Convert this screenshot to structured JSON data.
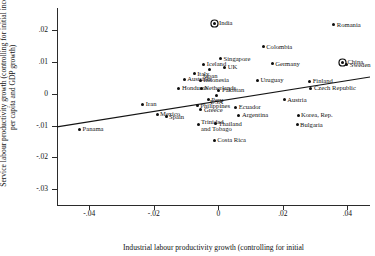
{
  "chart_data": {
    "type": "scatter",
    "title": "",
    "xlabel": "Industrial labour productivity growth (controlling for initial",
    "ylabel": "Service labour productivity growth (controlling for initial income per capita and GDP growth)",
    "xlim": [
      -0.05,
      0.047
    ],
    "ylim": [
      -0.035,
      0.027
    ],
    "xticks": [
      -0.04,
      -0.02,
      0,
      0.02,
      0.04
    ],
    "xticklabels": [
      "-.04",
      "-.02",
      "0",
      ".02",
      ".04"
    ],
    "yticks": [
      0.02,
      0.01,
      0,
      -0.01,
      -0.02,
      -0.03
    ],
    "yticklabels": [
      ".02",
      ".01",
      "0",
      "-.01",
      "-.02",
      "-.03"
    ],
    "grid": false,
    "legend": false,
    "fit_line": {
      "type": "linear",
      "x": [
        -0.05,
        0.047
      ],
      "y": [
        -0.0104,
        0.0053
      ]
    },
    "points": [
      {
        "name": "India",
        "x": -0.0012,
        "y": 0.0222,
        "highlight": true,
        "label_pos": "r"
      },
      {
        "name": "Romania",
        "x": 0.0358,
        "y": 0.0218,
        "highlight": false,
        "label_pos": "r"
      },
      {
        "name": "Colombia",
        "x": 0.0139,
        "y": 0.0148,
        "highlight": false,
        "label_pos": "r"
      },
      {
        "name": "Singapore",
        "x": 0.0007,
        "y": 0.0111,
        "highlight": false,
        "label_pos": "r"
      },
      {
        "name": "China",
        "x": 0.0386,
        "y": 0.01,
        "highlight": true,
        "label_pos": "r"
      },
      {
        "name": "Sweden",
        "x": 0.0398,
        "y": 0.0092,
        "highlight": false,
        "label_pos": "r"
      },
      {
        "name": "Iceland",
        "x": -0.0045,
        "y": 0.0093,
        "highlight": false,
        "label_pos": "r"
      },
      {
        "name": "Germany",
        "x": 0.0167,
        "y": 0.0094,
        "highlight": false,
        "label_pos": "r"
      },
      {
        "name": "Japan",
        "x": -0.0026,
        "y": 0.0078,
        "highlight": false,
        "label_pos": "c"
      },
      {
        "name": "UK",
        "x": 0.002,
        "y": 0.0083,
        "highlight": false,
        "label_pos": "r"
      },
      {
        "name": "Italy",
        "x": -0.0075,
        "y": 0.0063,
        "highlight": false,
        "label_pos": "r"
      },
      {
        "name": "Australia",
        "x": -0.0106,
        "y": 0.0045,
        "highlight": false,
        "label_pos": "r"
      },
      {
        "name": "Indonesia",
        "x": -0.0056,
        "y": 0.0043,
        "highlight": false,
        "label_pos": "r"
      },
      {
        "name": "Uruguay",
        "x": 0.0121,
        "y": 0.0043,
        "highlight": false,
        "label_pos": "r"
      },
      {
        "name": "Finland",
        "x": 0.0283,
        "y": 0.004,
        "highlight": false,
        "label_pos": "r"
      },
      {
        "name": "Honduras",
        "x": -0.0122,
        "y": 0.0018,
        "highlight": false,
        "label_pos": "r"
      },
      {
        "name": "Netherlands",
        "x": -0.0053,
        "y": 0.0018,
        "highlight": false,
        "label_pos": "r"
      },
      {
        "name": "Czech Republic",
        "x": 0.0287,
        "y": 0.0018,
        "highlight": false,
        "label_pos": "r"
      },
      {
        "name": "Pakistan",
        "x": 0.0002,
        "y": 0.0011,
        "highlight": false,
        "label_pos": "r"
      },
      {
        "name": "USA",
        "x": -0.0005,
        "y": -0.0004,
        "highlight": false,
        "label_pos": "c"
      },
      {
        "name": "Peru",
        "x": -0.0031,
        "y": -0.0018,
        "highlight": false,
        "label_pos": "r"
      },
      {
        "name": "Austria",
        "x": 0.0204,
        "y": -0.0018,
        "highlight": false,
        "label_pos": "r"
      },
      {
        "name": "Iran",
        "x": -0.0234,
        "y": -0.0033,
        "highlight": false,
        "label_pos": "r"
      },
      {
        "name": "Philippines",
        "x": -0.0065,
        "y": -0.0037,
        "highlight": false,
        "label_pos": "r"
      },
      {
        "name": "Ecuador",
        "x": 0.0054,
        "y": -0.0043,
        "highlight": false,
        "label_pos": "r"
      },
      {
        "name": "Greece",
        "x": -0.0054,
        "y": -0.005,
        "highlight": false,
        "label_pos": "r"
      },
      {
        "name": "Mexico",
        "x": -0.019,
        "y": -0.0065,
        "highlight": false,
        "label_pos": "r"
      },
      {
        "name": "Spain",
        "x": -0.0162,
        "y": -0.0072,
        "highlight": false,
        "label_pos": "r"
      },
      {
        "name": "Argentina",
        "x": 0.0064,
        "y": -0.0068,
        "highlight": false,
        "label_pos": "r"
      },
      {
        "name": "Korea, Rep.",
        "x": 0.0247,
        "y": -0.0068,
        "highlight": false,
        "label_pos": "r"
      },
      {
        "name": "Trinidad\nand Tobago",
        "x": -0.0063,
        "y": -0.0098,
        "highlight": false,
        "label_pos": "r"
      },
      {
        "name": "Thailand",
        "x": -0.0009,
        "y": -0.0095,
        "highlight": false,
        "label_pos": "r"
      },
      {
        "name": "Bulgaria",
        "x": 0.0244,
        "y": -0.0098,
        "highlight": false,
        "label_pos": "r"
      },
      {
        "name": "Panama",
        "x": -0.043,
        "y": -0.0112,
        "highlight": false,
        "label_pos": "r"
      },
      {
        "name": "Costa Rica",
        "x": -0.0013,
        "y": -0.0147,
        "highlight": false,
        "label_pos": "r"
      }
    ]
  }
}
